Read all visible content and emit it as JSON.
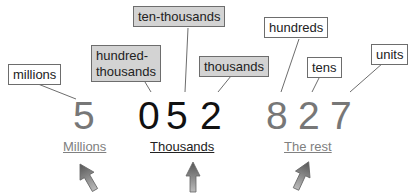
{
  "labels": {
    "millions": "millions",
    "hundred_thousands_1": "hundred-",
    "hundred_thousands_2": "thousands",
    "ten_thousands": "ten-thousands",
    "thousands": "thousands",
    "hundreds": "hundreds",
    "tens": "tens",
    "units": "units"
  },
  "digits": [
    "5",
    "0",
    "5",
    "2",
    "8",
    "2",
    "7"
  ],
  "groups": {
    "millions": "Millions",
    "thousands": "Thousands",
    "rest": "The rest"
  },
  "colors": {
    "grey_text": "#777777",
    "black_text": "#111111",
    "grey_box": "#d3d3d3"
  }
}
